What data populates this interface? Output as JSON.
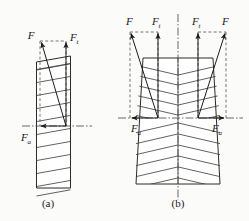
{
  "figure": {
    "background_color": "#fbfbfa",
    "line_color": "#2b2b2b",
    "panels": [
      {
        "id": "a",
        "caption": "(a)",
        "description": "Single helical gear tooth face with resolved normal force",
        "labels": [
          {
            "key": "F",
            "base": "F",
            "sub": ""
          },
          {
            "key": "Ft",
            "base": "F",
            "sub": "t"
          },
          {
            "key": "Fa",
            "base": "F",
            "sub": "a"
          }
        ]
      },
      {
        "id": "b",
        "caption": "(b)",
        "description": "Herringbone (double helical) gear with opposing axial forces cancelling",
        "labels": [
          {
            "key": "F_left",
            "base": "F",
            "sub": ""
          },
          {
            "key": "Ft_left",
            "base": "F",
            "sub": "t"
          },
          {
            "key": "Ft_right",
            "base": "F",
            "sub": "t"
          },
          {
            "key": "F_right",
            "base": "F",
            "sub": ""
          },
          {
            "key": "Fa_left",
            "base": "F",
            "sub": "a"
          },
          {
            "key": "Fa_right",
            "base": "F",
            "sub": "a"
          }
        ]
      }
    ],
    "captions": {
      "panel_a": "(a)",
      "panel_b": "(b)"
    },
    "symbols": {
      "F": "F",
      "sub_t": "t",
      "sub_a": "a"
    }
  }
}
